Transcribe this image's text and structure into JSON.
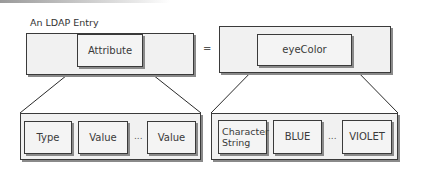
{
  "diagram": {
    "title": "An LDAP Entry",
    "equals_sign": "=",
    "top_left": {
      "inner_label": "Attribute"
    },
    "top_right": {
      "inner_label": "eyeColor"
    },
    "bottom_left": {
      "items": [
        "Type",
        "Value",
        "Value"
      ],
      "ellipsis": "..."
    },
    "bottom_right": {
      "items": [
        "Character String",
        "BLUE",
        "VIOLET"
      ],
      "ellipsis": "..."
    },
    "colors": {
      "stroke": "#3a3a3a",
      "fill": "#f3f3f3",
      "shadow": "#8a8a8a"
    }
  }
}
